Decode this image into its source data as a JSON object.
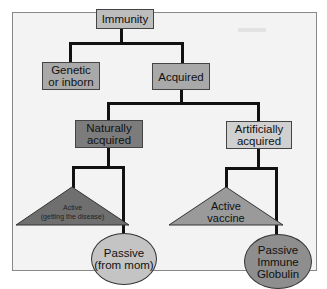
{
  "diagram": {
    "root": {
      "label": "Immunity",
      "color": "#bdbdbd"
    },
    "genetic": {
      "label_line1": "Genetic",
      "label_line2": "or inborn",
      "color": "#a9a9a9"
    },
    "acquired": {
      "label": "Acquired",
      "color": "#a9a9a9"
    },
    "naturally": {
      "label_line1": "Naturally",
      "label_line2": "acquired",
      "color": "#7c7c7c"
    },
    "artificially": {
      "label_line1": "Artificially",
      "label_line2": "acquired",
      "color": "#d0d0d0"
    },
    "active_natural": {
      "label_line1": "Active",
      "label_line2": "(getting the disease)",
      "color": "#6f6f6f"
    },
    "active_vaccine": {
      "label_line1": "Active",
      "label_line2": "vaccine",
      "color": "#9a9a9a"
    },
    "passive_mom": {
      "label_line1": "Passive",
      "label_line2": "(from mom)",
      "color": "#c4c4c4"
    },
    "passive_globulin": {
      "label_line1": "Passive",
      "label_line2": "Immune",
      "label_line3": "Globulin",
      "color": "#8e8e8e"
    }
  }
}
